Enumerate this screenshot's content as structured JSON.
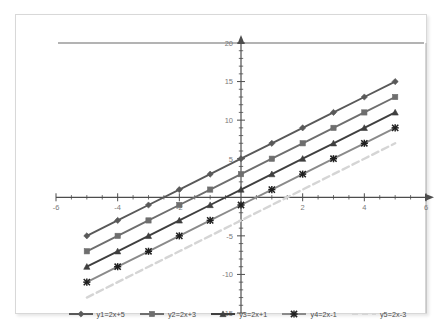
{
  "chart_data": {
    "type": "line",
    "title": "",
    "xlabel": "",
    "ylabel": "",
    "xlim": [
      -6,
      6
    ],
    "ylim": [
      -15,
      20
    ],
    "x_ticks": [
      -6,
      -4,
      -2,
      0,
      2,
      4,
      6
    ],
    "x_tick_labels": [
      "-6",
      "-4",
      "-2",
      "",
      "2",
      "4",
      "6"
    ],
    "y_ticks": [
      -15,
      -10,
      -5,
      0,
      5,
      10,
      15,
      20
    ],
    "y_tick_labels": [
      "-15",
      "-10",
      "-5",
      "",
      "5",
      "10",
      "15",
      "20"
    ],
    "x_minor_step": 0.5,
    "y_minor_step": 1,
    "grid": false,
    "legend_position": "bottom",
    "x": [
      -5,
      -4,
      -3,
      -2,
      -1,
      0,
      1,
      2,
      3,
      4,
      5
    ],
    "series": [
      {
        "name": "y1=2x+5",
        "slope": 2,
        "intercept": 5,
        "color": "#595959",
        "marker": "diamond",
        "dash": "solid",
        "values": [
          -5,
          -3,
          -1,
          1,
          3,
          5,
          7,
          9,
          11,
          13,
          15
        ]
      },
      {
        "name": "y2=2x+3",
        "slope": 2,
        "intercept": 3,
        "color": "#6e6e6e",
        "marker": "square",
        "dash": "solid",
        "values": [
          -7,
          -5,
          -3,
          -1,
          1,
          3,
          5,
          7,
          9,
          11,
          13
        ]
      },
      {
        "name": "y3=2x+1",
        "slope": 2,
        "intercept": 1,
        "color": "#3f3f3f",
        "marker": "triangle",
        "dash": "solid",
        "values": [
          -9,
          -7,
          -5,
          -3,
          -1,
          1,
          3,
          5,
          7,
          9,
          11
        ]
      },
      {
        "name": "y4=2x-1",
        "slope": 2,
        "intercept": -1,
        "color": "#8a8a8a",
        "marker": "cross",
        "dash": "solid",
        "values": [
          -11,
          -9,
          -7,
          -5,
          -3,
          -1,
          1,
          3,
          5,
          7,
          9
        ]
      },
      {
        "name": "y5=2x-3",
        "slope": 2,
        "intercept": -3,
        "color": "#d5d5d5",
        "marker": "none",
        "dash": "dashed",
        "values": [
          -13,
          -11,
          -9,
          -7,
          -5,
          -3,
          -1,
          1,
          3,
          5,
          7
        ]
      }
    ],
    "axis_color": "#4d4d4d",
    "frame_color": "#bfbfbf",
    "top_rule_color": "#9a9a9a",
    "background": "#ffffff"
  }
}
